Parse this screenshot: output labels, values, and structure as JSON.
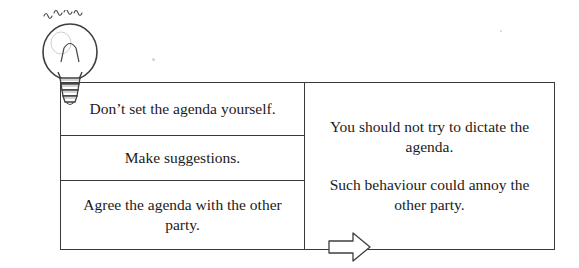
{
  "diagram": {
    "type": "process-flow",
    "icon": "lightbulb-icon",
    "left_column": {
      "items": [
        "Don’t set the agenda yourself.",
        "Make suggestions.",
        "Agree the agenda with the other party."
      ]
    },
    "connector": "right-arrow-icon",
    "right_column": {
      "paragraphs": [
        "You should not try to dictate the agenda.",
        "Such behaviour could annoy the other party."
      ]
    }
  },
  "colors": {
    "border": "#3a3a3a",
    "text": "#1b1b1b",
    "background": "#ffffff"
  }
}
